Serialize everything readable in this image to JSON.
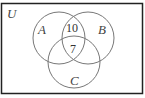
{
  "diagram": {
    "type": "venn",
    "universe_label": "U",
    "sets": [
      {
        "name": "A",
        "label": "A"
      },
      {
        "name": "B",
        "label": "B"
      },
      {
        "name": "C",
        "label": "C"
      }
    ],
    "regions": {
      "A_and_B_only": "10",
      "A_and_B_and_C": "7"
    },
    "colors": {
      "border": "#111111",
      "circle": "#777777",
      "text": "#333333"
    }
  }
}
